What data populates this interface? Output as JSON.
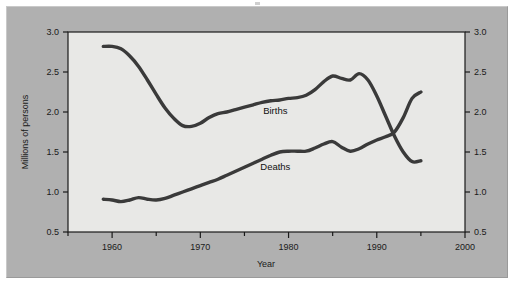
{
  "figure": {
    "panel_bg": "#b0b0b0",
    "plot_bg": "#e8e8e6",
    "line_color": "#3a3a3a",
    "axis_color": "#1a1a1a"
  },
  "chart_data": {
    "type": "line",
    "title": "",
    "xlabel": "Year",
    "ylabel": "Millions of persons",
    "xlim": [
      1955,
      2000
    ],
    "ylim": [
      0.5,
      3.0
    ],
    "grid": false,
    "legend_position": "inline",
    "x_ticks": [
      1960,
      1970,
      1980,
      1990,
      2000
    ],
    "x_minor_ticks": [
      1955,
      1965,
      1975,
      1985,
      1995
    ],
    "y_ticks": [
      0.5,
      1.0,
      1.5,
      2.0,
      2.5,
      3.0
    ],
    "y_ticks_right": [
      0.5,
      1.0,
      1.5,
      2.0,
      2.5,
      3.0
    ],
    "x_tick_labels": [
      "1960",
      "1970",
      "1980",
      "1990",
      "2000"
    ],
    "y_tick_labels": [
      "0.5",
      "1.0",
      "1.5",
      "2.0",
      "2.5",
      "3.0"
    ],
    "y_tick_labels_right": [
      "0.5",
      "1.0",
      "1.5",
      "2.0",
      "2.5",
      "3.0"
    ],
    "series": [
      {
        "name": "Births",
        "label": "Births",
        "label_x": 1978.5,
        "label_y": 1.97,
        "x": [
          1959,
          1960,
          1961,
          1962,
          1963,
          1964,
          1965,
          1966,
          1967,
          1968,
          1969,
          1970,
          1971,
          1972,
          1973,
          1974,
          1975,
          1976,
          1977,
          1978,
          1979,
          1980,
          1981,
          1982,
          1983,
          1984,
          1985,
          1986,
          1987,
          1988,
          1989,
          1990,
          1991,
          1992,
          1993,
          1994,
          1995
        ],
        "values": [
          2.82,
          2.82,
          2.79,
          2.7,
          2.57,
          2.4,
          2.22,
          2.05,
          1.92,
          1.83,
          1.82,
          1.86,
          1.93,
          1.98,
          2.0,
          2.03,
          2.06,
          2.09,
          2.12,
          2.14,
          2.15,
          2.17,
          2.18,
          2.21,
          2.28,
          2.38,
          2.45,
          2.42,
          2.4,
          2.48,
          2.4,
          2.2,
          1.95,
          1.7,
          1.5,
          1.38,
          1.39
        ]
      },
      {
        "name": "Deaths",
        "label": "Deaths",
        "label_x": 1978.5,
        "label_y": 1.28,
        "x": [
          1959,
          1960,
          1961,
          1962,
          1963,
          1964,
          1965,
          1966,
          1967,
          1968,
          1969,
          1970,
          1971,
          1972,
          1973,
          1974,
          1975,
          1976,
          1977,
          1978,
          1979,
          1980,
          1981,
          1982,
          1983,
          1984,
          1985,
          1986,
          1987,
          1988,
          1989,
          1990,
          1991,
          1992,
          1993,
          1994,
          1995
        ],
        "values": [
          0.91,
          0.9,
          0.88,
          0.9,
          0.93,
          0.91,
          0.9,
          0.92,
          0.96,
          1.0,
          1.04,
          1.08,
          1.12,
          1.16,
          1.21,
          1.26,
          1.31,
          1.36,
          1.41,
          1.46,
          1.5,
          1.51,
          1.51,
          1.51,
          1.55,
          1.6,
          1.63,
          1.56,
          1.51,
          1.54,
          1.6,
          1.65,
          1.69,
          1.75,
          1.93,
          2.17,
          2.25
        ]
      }
    ]
  }
}
